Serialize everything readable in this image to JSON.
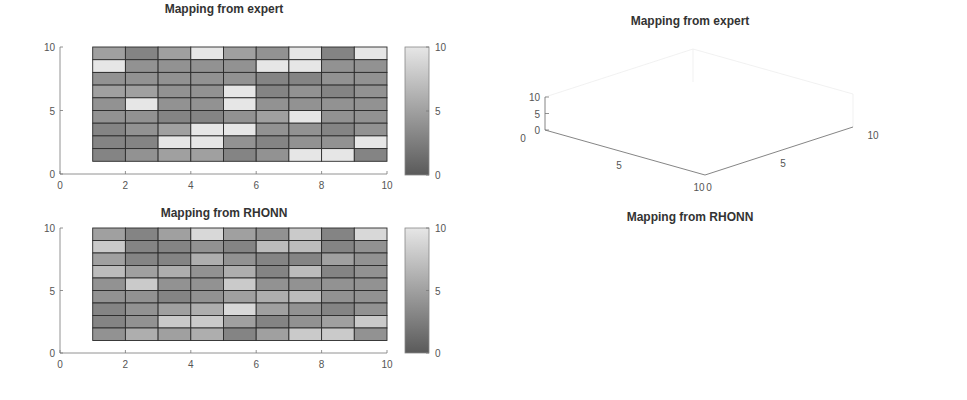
{
  "figure": {
    "panels": [
      {
        "id": "heatmap-expert",
        "title": "Mapping from expert"
      },
      {
        "id": "surface-expert",
        "title": "Mapping from expert"
      },
      {
        "id": "heatmap-rhonn",
        "title": "Mapping from RHONN"
      },
      {
        "id": "surface-rhonn",
        "title": "Mapping from RHONN"
      }
    ],
    "heatmap_x_ticks": [
      "0",
      "2",
      "4",
      "6",
      "8",
      "10"
    ],
    "heatmap_y_ticks": [
      "0",
      "5",
      "10"
    ],
    "colorbar_ticks": [
      "0",
      "5",
      "10"
    ],
    "surface_expert_z_ticks": [
      "0",
      "5",
      "10"
    ],
    "surface_rhonn_z_ticks": [
      "0",
      "10",
      "20"
    ],
    "surface_left_axis_ticks": [
      "0",
      "5",
      "10"
    ],
    "surface_right_axis_ticks": [
      "0",
      "5",
      "10"
    ],
    "colors": {
      "low": "#5a5a5a",
      "high": "#e6e6e6",
      "edge": "#2b2b2b",
      "axis": "#555555"
    }
  },
  "chart_data": [
    {
      "type": "heatmap",
      "title": "Mapping from expert",
      "x_edges": [
        1,
        2,
        3,
        4,
        5,
        6,
        7,
        8,
        9,
        10
      ],
      "y_edges": [
        1,
        2,
        3,
        4,
        5,
        6,
        7,
        8,
        9,
        10
      ],
      "rows_top_to_bottom": [
        [
          5,
          3,
          5,
          10,
          5,
          4,
          10,
          3,
          10
        ],
        [
          10,
          4,
          4,
          4,
          4,
          10,
          10,
          4,
          4
        ],
        [
          4,
          4,
          4,
          4,
          4,
          3,
          3,
          4,
          4
        ],
        [
          5,
          5,
          4,
          4,
          10,
          3,
          4,
          3,
          4
        ],
        [
          4,
          10,
          4,
          4,
          10,
          4,
          4,
          4,
          4
        ],
        [
          4,
          4,
          3,
          3,
          4,
          5,
          10,
          4,
          4
        ],
        [
          3,
          4,
          5,
          10,
          10,
          4,
          4,
          3,
          4
        ],
        [
          3,
          3,
          10,
          10,
          4,
          3,
          4,
          4,
          10
        ],
        [
          3,
          4,
          5,
          5,
          3,
          4,
          10,
          10,
          3
        ]
      ],
      "xlim": [
        0,
        10
      ],
      "ylim": [
        0,
        10
      ],
      "clim": [
        0,
        10
      ],
      "xticks": [
        0,
        2,
        4,
        6,
        8,
        10
      ],
      "yticks": [
        0,
        5,
        10
      ],
      "colorbar": true
    },
    {
      "type": "surface",
      "title": "Mapping from expert",
      "data_ref": "same matrix as heatmap 'Mapping from expert'",
      "zlim": [
        0,
        10
      ],
      "zticks": [
        0,
        5,
        10
      ],
      "xticks": [
        0,
        5,
        10
      ],
      "yticks": [
        0,
        5,
        10
      ],
      "clim": [
        0,
        10
      ],
      "colorbar": true
    },
    {
      "type": "heatmap",
      "title": "Mapping from RHONN",
      "x_edges": [
        1,
        2,
        3,
        4,
        5,
        6,
        7,
        8,
        9,
        10
      ],
      "y_edges": [
        1,
        2,
        3,
        4,
        5,
        6,
        7,
        8,
        9,
        10
      ],
      "rows_top_to_bottom": [
        [
          5,
          3,
          5,
          9,
          5,
          4,
          8,
          3,
          9
        ],
        [
          8,
          3,
          3,
          4,
          3,
          7,
          7,
          3,
          4
        ],
        [
          5,
          3,
          3,
          6,
          4,
          3,
          3,
          5,
          4
        ],
        [
          7,
          5,
          6,
          4,
          6,
          3,
          7,
          3,
          4
        ],
        [
          4,
          8,
          4,
          4,
          8,
          4,
          4,
          4,
          4
        ],
        [
          4,
          4,
          3,
          4,
          5,
          6,
          7,
          4,
          4
        ],
        [
          3,
          4,
          5,
          6,
          9,
          5,
          4,
          3,
          4
        ],
        [
          3,
          4,
          8,
          8,
          5,
          3,
          4,
          5,
          8
        ],
        [
          4,
          6,
          5,
          6,
          3,
          5,
          8,
          8,
          4
        ]
      ],
      "xlim": [
        0,
        10
      ],
      "ylim": [
        0,
        10
      ],
      "clim": [
        0,
        10
      ],
      "xticks": [
        0,
        2,
        4,
        6,
        8,
        10
      ],
      "yticks": [
        0,
        5,
        10
      ],
      "colorbar": true
    },
    {
      "type": "surface",
      "title": "Mapping from RHONN",
      "data_ref": "same matrix as heatmap 'Mapping from RHONN'",
      "zlim": [
        0,
        20
      ],
      "zticks": [
        0,
        10,
        20
      ],
      "xticks": [
        0,
        5,
        10
      ],
      "yticks": [
        0,
        5,
        10
      ],
      "clim": [
        0,
        10
      ],
      "colorbar": true
    }
  ]
}
